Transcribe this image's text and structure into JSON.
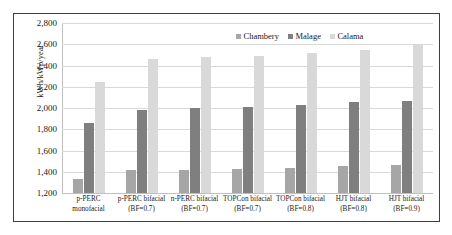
{
  "chart_data": {
    "type": "bar",
    "title": "",
    "xlabel": "",
    "ylabel": "kWh/kWp/year",
    "ylim": [
      1200,
      2800
    ],
    "ytick_step": 200,
    "yticks": [
      "1,200",
      "1,400",
      "1,600",
      "1,800",
      "2,000",
      "2,200",
      "2,400",
      "2,600",
      "2,800"
    ],
    "grid": true,
    "legend_position": "top-right",
    "categories": [
      "p-PERC monofacial",
      "p-PERC bifacial (BF=0.7)",
      "n-PERC bifacial (BF=0.7)",
      "TOPCon bifacial (BF=0.7)",
      "TOPCon bifacial (BF=0.8)",
      "HJT bifacial (BF=0.8)",
      "HJT bifacial (BF=0.9)"
    ],
    "category_lines": [
      [
        "p-PERC",
        "monofacial"
      ],
      [
        "p-PERC bifacial",
        "(BF=0.7)"
      ],
      [
        "n-PERC bifacial",
        "(BF=0.7)"
      ],
      [
        "TOPCon bifacial",
        "(BF=0.7)"
      ],
      [
        "TOPCon bifacial",
        "(BF=0.8)"
      ],
      [
        "HJT bifacial",
        "(BF=0.8)"
      ],
      [
        "HJT bifacial",
        "(BF=0.9)"
      ]
    ],
    "series": [
      {
        "name": "Chambery",
        "color": "#a6a6a6",
        "values": [
          1330,
          1415,
          1420,
          1430,
          1440,
          1450,
          1465
        ]
      },
      {
        "name": "Malage",
        "color": "#7f7f7f",
        "values": [
          1855,
          1985,
          2000,
          2010,
          2025,
          2055,
          2065
        ]
      },
      {
        "name": "Calama",
        "color": "#d9d9d9",
        "values": [
          2245,
          2465,
          2480,
          2490,
          2520,
          2550,
          2590
        ]
      }
    ]
  },
  "colors": {
    "frame": "#3f3f3f",
    "gridline": "#d9d9d9",
    "axis": "#bfbfbf",
    "text": "#1a1a1a",
    "background": "#ffffff"
  }
}
